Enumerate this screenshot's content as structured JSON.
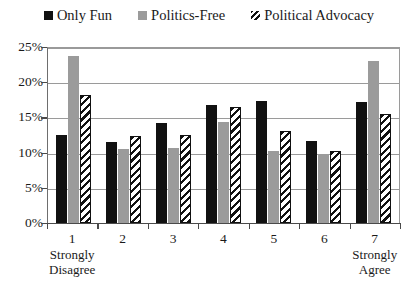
{
  "legend": {
    "position": "top-center",
    "items": [
      {
        "label": "Only Fun",
        "swatch": "solid-black-square-icon",
        "color": "#111111"
      },
      {
        "label": "Politics-Free",
        "swatch": "solid-gray-square-icon",
        "color": "#9b9b9b"
      },
      {
        "label": "Political Advocacy",
        "swatch": "diagonal-hatched-square-icon",
        "color": "#ffffff"
      }
    ]
  },
  "axes": {
    "y_ticks": [
      "0%",
      "5%",
      "10%",
      "15%",
      "20%",
      "25%"
    ],
    "x_ticks": [
      "1",
      "2",
      "3",
      "4",
      "5",
      "6",
      "7"
    ],
    "x_anchor_low": "Strongly\nDisagree",
    "x_anchor_high": "Strongly\nAgree"
  },
  "x_labels": [
    {
      "num": "1",
      "caption_line1": "Strongly",
      "caption_line2": "Disagree"
    },
    {
      "num": "2",
      "caption_line1": "",
      "caption_line2": ""
    },
    {
      "num": "3",
      "caption_line1": "",
      "caption_line2": ""
    },
    {
      "num": "4",
      "caption_line1": "",
      "caption_line2": ""
    },
    {
      "num": "5",
      "caption_line1": "",
      "caption_line2": ""
    },
    {
      "num": "6",
      "caption_line1": "",
      "caption_line2": ""
    },
    {
      "num": "7",
      "caption_line1": "Strongly",
      "caption_line2": "Agree"
    }
  ],
  "chart_data": {
    "type": "bar",
    "title": "",
    "subtitle": "",
    "xlabel": "",
    "ylabel": "",
    "ylim": [
      0,
      25
    ],
    "ytick_step": 5,
    "ytick_format": "percent",
    "grid": true,
    "grid_axis": "y",
    "legend_position": "top-center",
    "orientation": "vertical",
    "grouped": true,
    "categories": [
      "1",
      "2",
      "3",
      "4",
      "5",
      "6",
      "7"
    ],
    "category_anchors": {
      "1": "Strongly Disagree",
      "7": "Strongly Agree"
    },
    "series": [
      {
        "name": "Only Fun",
        "color": "#111111",
        "pattern": "solid",
        "values": [
          12.5,
          11.5,
          14.2,
          16.7,
          17.3,
          11.7,
          17.2
        ]
      },
      {
        "name": "Politics-Free",
        "color": "#9b9b9b",
        "pattern": "solid",
        "values": [
          23.7,
          10.5,
          10.7,
          14.3,
          10.3,
          9.8,
          23.0
        ]
      },
      {
        "name": "Political Advocacy",
        "color": "#ffffff",
        "pattern": "diagonal-hatch",
        "values": [
          18.2,
          12.3,
          12.5,
          16.5,
          13.0,
          10.3,
          15.5
        ]
      }
    ]
  }
}
